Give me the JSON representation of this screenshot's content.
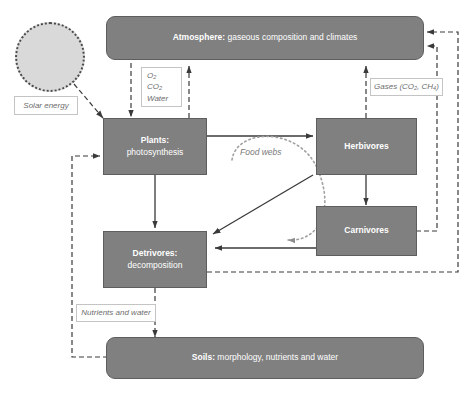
{
  "diagram": {
    "colors": {
      "box_fill": "#808080",
      "box_border": "#5e5e5e",
      "box_text": "#ffffff",
      "sun_fill": "#d9d9d9",
      "sun_border": "#4a4a4a",
      "label_text": "#6d6d6d",
      "label_border": "#c4c4c4",
      "arrow_solid": "#3a3a3a",
      "arrow_dashed": "#3a3a3a",
      "arrow_dotted": "#9a9a9a",
      "background": "#ffffff"
    }
  },
  "nodes": {
    "atmosphere": {
      "title": "Atmosphere:",
      "subtitle": "gaseous composition and climates",
      "shape": "rounded-bar"
    },
    "plants": {
      "title": "Plants:",
      "subtitle": "photosynthesis",
      "shape": "rect"
    },
    "herbivores": {
      "title": "Herbivores",
      "subtitle": "",
      "shape": "rect"
    },
    "carnivores": {
      "title": "Carnivores",
      "subtitle": "",
      "shape": "rect"
    },
    "detrivores": {
      "title": "Detrivores:",
      "subtitle": "decomposition",
      "shape": "rect"
    },
    "soils": {
      "title": "Soils:",
      "subtitle": "morphology, nutrients and water",
      "shape": "rounded-bar"
    }
  },
  "labels": {
    "solar_energy": "Solar energy",
    "gas_exchange_line1": "O₂",
    "gas_exchange_line2": "CO₂",
    "gas_exchange_line3": "Water",
    "gases": "Gases (CO₂, CH₄)",
    "nutrients_and_water": "Nutrients and water",
    "food_webs": "Food webs"
  },
  "icons": {
    "sun": "sun-icon"
  },
  "flows": [
    {
      "from": "sun",
      "to": "plants",
      "style": "dashed",
      "meaning": "Solar energy"
    },
    {
      "from": "atmosphere",
      "to": "plants",
      "style": "dashed",
      "meaning": "O₂, CO₂, Water"
    },
    {
      "from": "plants",
      "to": "atmosphere",
      "style": "dashed",
      "meaning": "O₂, CO₂, Water"
    },
    {
      "from": "herbivores",
      "to": "atmosphere",
      "style": "dashed",
      "meaning": "Gases (CO₂, CH₄)"
    },
    {
      "from": "carnivores",
      "to": "atmosphere",
      "style": "dashed",
      "meaning": "Gases (CO₂, CH₄)"
    },
    {
      "from": "detrivores",
      "to": "atmosphere",
      "style": "dashed",
      "meaning": "Gases (CO₂, CH₄)"
    },
    {
      "from": "plants",
      "to": "herbivores",
      "style": "solid",
      "meaning": "consumption"
    },
    {
      "from": "herbivores",
      "to": "carnivores",
      "style": "solid",
      "meaning": "predation"
    },
    {
      "from": "plants",
      "to": "detrivores",
      "style": "solid",
      "meaning": "litter"
    },
    {
      "from": "herbivores",
      "to": "detrivores",
      "style": "solid",
      "meaning": "dead matter"
    },
    {
      "from": "carnivores",
      "to": "detrivores",
      "style": "solid",
      "meaning": "dead matter"
    },
    {
      "from": "detrivores",
      "to": "soils",
      "style": "dashed",
      "meaning": "Nutrients and water"
    },
    {
      "from": "soils",
      "to": "plants",
      "style": "dashed",
      "meaning": "Nutrients and water"
    },
    {
      "from": "plants",
      "to": "carnivores",
      "style": "dotted",
      "meaning": "Food webs"
    }
  ]
}
